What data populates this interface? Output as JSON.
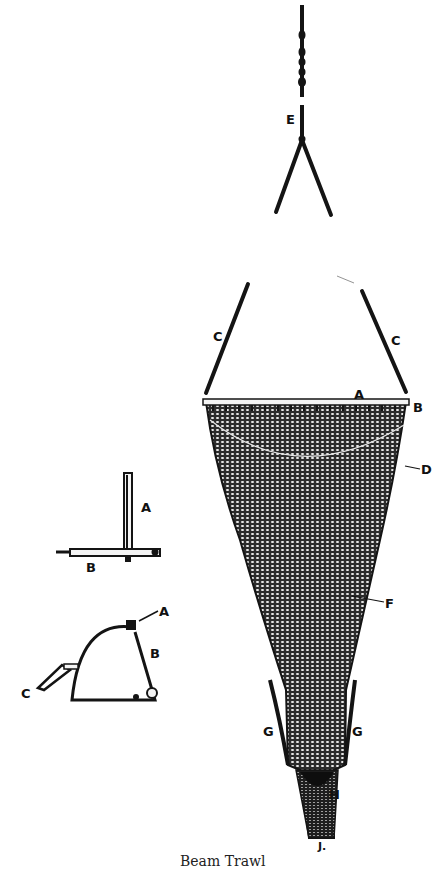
{
  "figure": {
    "caption": "Beam Trawl",
    "colors": {
      "ink": "#141414",
      "paper": "#ffffff"
    }
  },
  "main_trawl": {
    "labels": {
      "tow_rope": "E",
      "bridle_left": "C",
      "bridle_right": "C",
      "beam": "A",
      "trawl_head": "B",
      "ground_rope": "D",
      "net_body": "F",
      "pocket_left": "G",
      "pocket_right": "G",
      "cod_end": "H",
      "cod_end_tie": "J."
    }
  },
  "detail_beam_head": {
    "labels": {
      "beam": "A",
      "head_iron": "B"
    }
  },
  "detail_trawl_head_side": {
    "labels": {
      "beam_socket": "A",
      "iron_frame": "B",
      "shackle": "C"
    }
  }
}
